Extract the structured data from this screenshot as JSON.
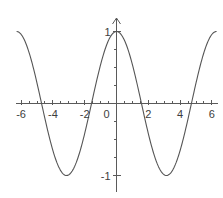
{
  "figure": {
    "title_partial": "",
    "background_color": "#ffffff",
    "curve_color": "#555555",
    "axis_color": "#5a5a5a",
    "label_color": "#3d3d3d"
  },
  "chart_data": {
    "type": "line",
    "title": "",
    "xlabel": "",
    "ylabel": "",
    "function": "y = cos(x)",
    "xlim": [
      -6.45,
      6.45
    ],
    "ylim": [
      -1.28,
      1.28
    ],
    "grid": false,
    "legend": null,
    "x_ticks_major": [
      -6,
      -4,
      -2,
      0,
      2,
      4,
      6
    ],
    "x_tick_labels": [
      "-6",
      "-4",
      "-2",
      "0",
      "2",
      "4",
      "6"
    ],
    "x_tick_minor_step": 0.5,
    "y_ticks_major": [
      -1,
      1
    ],
    "y_tick_labels": [
      "-1",
      "1"
    ],
    "y_tick_minor_step": 0.25,
    "amplitude": 1,
    "period": 6.283,
    "maxima_x": [
      0
    ],
    "minima_x": [
      -3.14,
      3.14
    ],
    "zero_crossings": [
      -4.71,
      -1.57,
      1.57,
      4.71
    ],
    "x": [
      -6.45,
      -6.2,
      -5.95,
      -5.7,
      -5.45,
      -5.2,
      -4.95,
      -4.71,
      -4.45,
      -4.2,
      -3.95,
      -3.7,
      -3.45,
      -3.14,
      -2.85,
      -2.6,
      -2.35,
      -2.1,
      -1.85,
      -1.57,
      -1.3,
      -1.05,
      -0.8,
      -0.55,
      -0.3,
      0,
      0.3,
      0.55,
      0.8,
      1.05,
      1.3,
      1.57,
      1.85,
      2.1,
      2.35,
      2.6,
      2.85,
      3.14,
      3.45,
      3.7,
      3.95,
      4.2,
      4.45,
      4.71,
      4.95,
      5.2,
      5.45,
      5.7,
      5.95,
      6.2,
      6.45
    ],
    "y": [
      0.99,
      0.98,
      0.94,
      0.84,
      0.68,
      0.47,
      0.23,
      0,
      -0.25,
      -0.49,
      -0.69,
      -0.84,
      -0.95,
      -1,
      -0.96,
      -0.86,
      -0.71,
      -0.51,
      -0.28,
      0,
      0.27,
      0.5,
      0.7,
      0.85,
      0.96,
      1,
      0.96,
      0.85,
      0.7,
      0.5,
      0.27,
      0,
      -0.28,
      -0.51,
      -0.71,
      -0.86,
      -0.96,
      -1,
      -0.95,
      -0.84,
      -0.69,
      -0.49,
      -0.25,
      0,
      0.23,
      0.47,
      0.68,
      0.84,
      0.94,
      0.98,
      0.99
    ]
  }
}
